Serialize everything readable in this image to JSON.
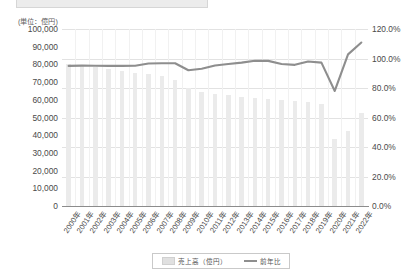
{
  "axis": {
    "unit_caption": "(単位：億円)",
    "left_ticks": [
      "100,000",
      "90,000",
      "80,000",
      "70,000",
      "60,000",
      "50,000",
      "40,000",
      "30,000",
      "20,000",
      "10,000",
      "0"
    ],
    "right_ticks": [
      "120.0%",
      "100.0%",
      "80.0%",
      "60.0%",
      "40.0%",
      "20.0%",
      "0.0%"
    ]
  },
  "legend": {
    "bar_label": "売上高（億円）",
    "line_label": "前年比"
  },
  "chart_data": {
    "type": "bar",
    "title": "",
    "subtitle": "",
    "xlabel": "",
    "ylabel": "(単位：億円)",
    "y2label": "",
    "ylim": [
      0,
      100000
    ],
    "y2lim": [
      0,
      1.2
    ],
    "grid": true,
    "legend_position": "bottom",
    "categories": [
      "2000年",
      "2001年",
      "2002年",
      "2003年",
      "2004年",
      "2005年",
      "2006年",
      "2007年",
      "2008年",
      "2009年",
      "2010年",
      "2011年",
      "2012年",
      "2013年",
      "2014年",
      "2015年",
      "2016年",
      "2017年",
      "2018年",
      "2019年",
      "2020年",
      "2021年",
      "2022年"
    ],
    "series": [
      {
        "name": "売上高（億円）",
        "type": "bar",
        "axis": "left",
        "color": "#ebebeb",
        "values": [
          80500,
          79800,
          78500,
          77200,
          76500,
          75200,
          74800,
          73500,
          71000,
          66500,
          64500,
          63500,
          62500,
          61500,
          61000,
          60500,
          60000,
          59500,
          59000,
          57500,
          38000,
          42500,
          52500
        ]
      },
      {
        "name": "前年比",
        "type": "line",
        "axis": "right",
        "color": "#8e8e8e",
        "values": [
          0.95,
          0.952,
          0.951,
          0.95,
          0.95,
          0.951,
          0.966,
          0.968,
          0.968,
          0.92,
          0.93,
          0.952,
          0.963,
          0.972,
          0.985,
          0.984,
          0.963,
          0.957,
          0.98,
          0.972,
          0.78,
          1.028,
          1.108
        ]
      }
    ]
  }
}
